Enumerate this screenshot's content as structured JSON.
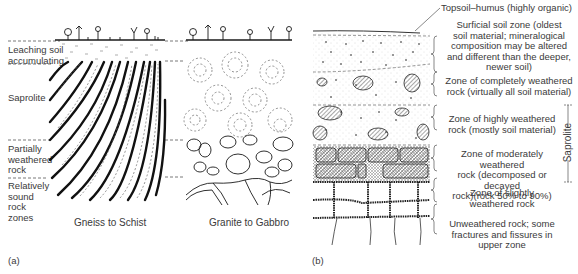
{
  "panel_a": {
    "tag": "(a)",
    "zone_labels": [
      {
        "text": "Leaching soil\naccumulating",
        "line1": "Leaching soil",
        "line2": "accumulating"
      },
      {
        "text": "Saprolite"
      },
      {
        "text": "Partially weathered rock",
        "line1": "Partially",
        "line2": "weathered",
        "line3": "rock"
      },
      {
        "text": "Relatively sound rock zones",
        "line1": "Relatively",
        "line2": "sound",
        "line3": "rock",
        "line4": "zones"
      }
    ],
    "columns": [
      {
        "caption": "Gneiss to Schist"
      },
      {
        "caption": "Granite to Gabbro"
      }
    ]
  },
  "panel_b": {
    "tag": "(b)",
    "topsoil_label": "Topsoil–humus (highly organic)",
    "zones": [
      {
        "lines": [
          "Surficial soil zone (oldest",
          "soil material; mineralogical",
          "composition may be altered",
          "and different than the deeper,",
          "newer soil)"
        ]
      },
      {
        "lines": [
          "Zone of completely weathered",
          "rock (virtually all soil material)"
        ]
      },
      {
        "lines": [
          "Zone of highly weathered",
          "rock (mostly soil material)"
        ]
      },
      {
        "lines": [
          "Zone of moderately weathered",
          "rock (decomposed or decayed",
          "rock)(rock 50% to 90%)"
        ]
      },
      {
        "lines": [
          "Zone of slightly",
          "weathered rock"
        ]
      },
      {
        "lines": [
          "Unweathered rock; some",
          "fractures and fissures in",
          "upper zone"
        ]
      }
    ],
    "saprolite_bracket_label": "Saprolite"
  },
  "colors": {
    "ink": "#1a1a1a",
    "text": "#3a3a3a",
    "dash": "#555555",
    "stipple": "#bbbbbb"
  }
}
